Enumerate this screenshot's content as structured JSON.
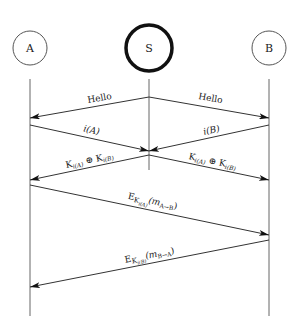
{
  "diagram": {
    "type": "sequence",
    "participants": [
      {
        "id": "A",
        "label": "A",
        "x": 30,
        "emphasis": false
      },
      {
        "id": "S",
        "label": "S",
        "x": 149,
        "emphasis": true
      },
      {
        "id": "B",
        "label": "B",
        "x": 269,
        "emphasis": false
      }
    ],
    "messages": [
      {
        "from": "S",
        "to": "A",
        "label": "Hello"
      },
      {
        "from": "S",
        "to": "B",
        "label": "Hello"
      },
      {
        "from": "A",
        "to": "S",
        "label": "i(A)"
      },
      {
        "from": "B",
        "to": "S",
        "label": "i(B)"
      },
      {
        "from": "S",
        "to": "A",
        "label_parts": [
          "K",
          "i(A)",
          " ⊕ ",
          "K",
          "i(B)"
        ]
      },
      {
        "from": "S",
        "to": "B",
        "label_parts": [
          "K",
          "i(A)",
          " ⊕ ",
          "K",
          "i(B)"
        ]
      },
      {
        "from": "A",
        "to": "B",
        "label_parts": [
          "E",
          "K",
          "i(A)",
          "(m",
          "A→B",
          ")"
        ]
      },
      {
        "from": "B",
        "to": "A",
        "label_parts": [
          "E",
          "K",
          "i(B)",
          "(m",
          "B→A",
          ")"
        ]
      }
    ],
    "labels": {
      "A": "A",
      "S": "S",
      "B": "B",
      "hello": "Hello",
      "iA_i": "i",
      "iA_arg": "(A)",
      "iB_i": "i",
      "iB_arg": "(B)",
      "K": "K",
      "subA": "i(A)",
      "subB": "i(B)",
      "xor": " ⊕ ",
      "E": "E",
      "m": "(m",
      "AtoB": "A→B",
      "BtoA": "B→A",
      "close": ")"
    },
    "colors": {
      "line": "#444444",
      "circle": "#555555",
      "server_circle": "#111111",
      "text": "#222222"
    }
  }
}
